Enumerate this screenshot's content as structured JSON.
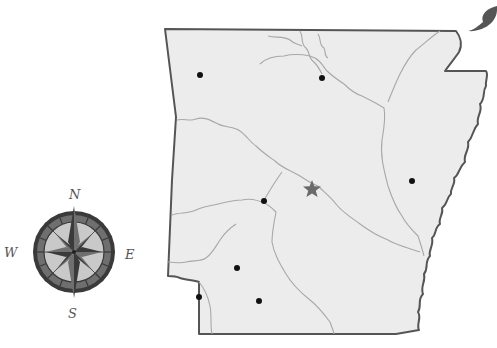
{
  "map": {
    "region": "Arkansas",
    "colors": {
      "background": "#ffffff",
      "land_fill": "#ececec",
      "border": "#555555",
      "river": "#a8a8a8",
      "city_dot": "#111111",
      "capital_star": "#6a6a6a",
      "compass_dark": "#3a3a3a",
      "compass_mid": "#6f6f6f",
      "compass_light": "#c9c9c9"
    },
    "capital": {
      "symbol": "star-icon",
      "x": 312,
      "y": 189
    },
    "cities": [
      {
        "id": "city-1",
        "x": 200,
        "y": 75
      },
      {
        "id": "city-2",
        "x": 322,
        "y": 78
      },
      {
        "id": "city-3",
        "x": 412,
        "y": 181
      },
      {
        "id": "city-4",
        "x": 264,
        "y": 201
      },
      {
        "id": "city-5",
        "x": 237,
        "y": 268
      },
      {
        "id": "city-6",
        "x": 259,
        "y": 301
      },
      {
        "id": "city-7",
        "x": 199,
        "y": 297
      }
    ]
  },
  "compass": {
    "north": "N",
    "east": "E",
    "south": "S",
    "west": "W"
  }
}
